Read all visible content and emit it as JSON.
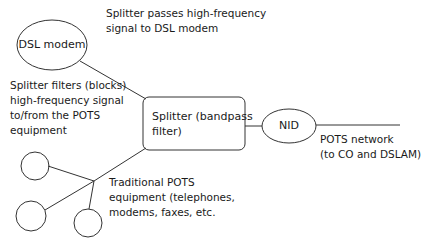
{
  "diagram": {
    "nodes": {
      "dsl_modem": "DSL modem",
      "splitter": [
        "Splitter (bandpass",
        "filter)"
      ],
      "nid": "NID"
    },
    "labels": {
      "passes": [
        "Splitter passes high-frequency",
        "signal to DSL modem"
      ],
      "filters": [
        "Splitter filters (blocks)",
        "high-frequency signal",
        "to/from the POTS",
        "equipment"
      ],
      "pots_network": [
        "POTS network",
        "(to CO and DSLAM)"
      ],
      "traditional": [
        "Traditional POTS",
        "equipment (telephones,",
        "modems, faxes, etc."
      ]
    },
    "colors": {
      "stroke": "#333333",
      "text": "#1a1a1a"
    }
  }
}
